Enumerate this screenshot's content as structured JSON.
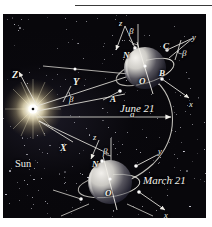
{
  "figure": {
    "kind": "astronomy-diagram",
    "background_color": "#08070b",
    "ink_color": "#f2f1ec",
    "page_color": "#ffffff"
  },
  "labels": {
    "sun": "Sun",
    "june": "June 21",
    "march": "March 21",
    "axis_Z": "Z",
    "axis_Y": "Y",
    "axis_X": "X",
    "axis_x_upper": "x",
    "axis_y_upper": "y",
    "axis_z_upper": "z",
    "axis_x_lower": "x",
    "axis_y_lower": "y",
    "axis_z_lower": "z",
    "beta_top": "β",
    "beta_right": "β",
    "beta_mid": "β",
    "beta_lower": "β",
    "point_N_upper": "N",
    "point_N_lower": "N",
    "point_C": "C",
    "point_B": "B",
    "point_A": "A",
    "point_O_upper": "O",
    "point_O_lower": "O",
    "distance_a": "a"
  },
  "colors": {
    "ink": "#f2f1ec",
    "plate": "#08070b",
    "sun_core": "#ffffff",
    "sun_glow": "#fff7d8",
    "globe_lit": "#e6e4e0",
    "globe_dark": "#1b1a22",
    "orbit": "#cfcdc6"
  }
}
